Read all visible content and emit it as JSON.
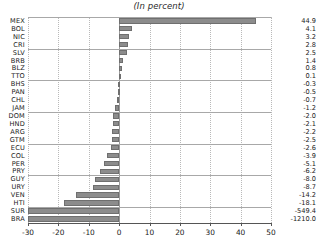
{
  "chart_data": {
    "type": "bar",
    "orientation": "horizontal",
    "title": "(In percent)",
    "xlabel": "",
    "ylabel": "",
    "xlim": [
      -30,
      50
    ],
    "xticks": [
      -30,
      -20,
      -10,
      0,
      10,
      20,
      30,
      40,
      50
    ],
    "xticklabels": [
      "-30",
      "-20",
      "-10",
      "0",
      "10",
      "20",
      "30",
      "40",
      "50"
    ],
    "grid": true,
    "grid_axis": "x",
    "legend": false,
    "bar_color": "#8c8c8c",
    "bar_edge_color": "#6f6f6f",
    "categories": [
      "MEX",
      "BOL",
      "NIC",
      "CRI",
      "SLV",
      "BRB",
      "BLZ",
      "TTO",
      "BHS",
      "PAN",
      "CHL",
      "JAM",
      "DOM",
      "HND",
      "ARG",
      "GTM",
      "ECU",
      "COL",
      "PER",
      "PRY",
      "GUY",
      "URY",
      "VEN",
      "HTI",
      "SUR",
      "BRA"
    ],
    "values": [
      44.9,
      4.1,
      3.2,
      2.8,
      2.5,
      1.4,
      0.8,
      0.1,
      -0.3,
      -0.5,
      -0.7,
      -1.2,
      -2.0,
      -2.1,
      -2.2,
      -2.5,
      -2.6,
      -3.9,
      -5.1,
      -6.2,
      -8.0,
      -8.7,
      -14.2,
      -18.1,
      -549.4,
      -1210.0
    ],
    "value_labels": [
      "44.9",
      "4.1",
      "3.2",
      "2.8",
      "2.5",
      "1.4",
      "0.8",
      "0.1",
      "-0.3",
      "-0.5",
      "-0.7",
      "-1.2",
      "-2.0",
      "-2.1",
      "-2.2",
      "-2.5",
      "-2.6",
      "-3.9",
      "-5.1",
      "-6.2",
      "-8.0",
      "-8.7",
      "-14.2",
      "-18.1",
      "-549.4",
      "-1210.0"
    ],
    "separator_after_rows": [
      3,
      7,
      11,
      15,
      19,
      23
    ]
  }
}
